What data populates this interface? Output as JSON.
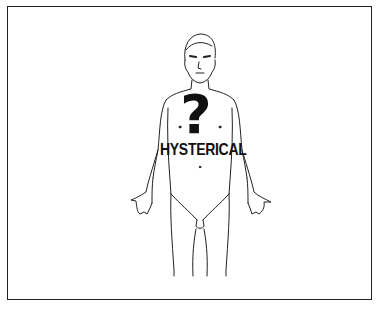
{
  "figure": {
    "symbol": "?",
    "label": "HYSTERICAL"
  },
  "colors": {
    "line": "#222222",
    "background": "#ffffff"
  }
}
